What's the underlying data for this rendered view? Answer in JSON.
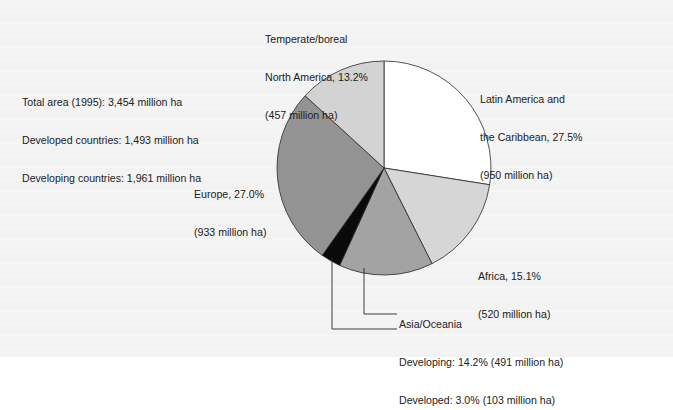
{
  "chart_data": {
    "type": "pie",
    "title": "",
    "unit": "million ha",
    "start_angle_deg": 0,
    "direction": "clockwise",
    "slices": [
      {
        "label": "Latin America and the Caribbean",
        "percent": 27.5,
        "value": 950,
        "color": "#ffffff"
      },
      {
        "label": "Africa",
        "percent": 15.1,
        "value": 520,
        "color": "#d6d6d6"
      },
      {
        "label": "Asia/Oceania Developing",
        "percent": 14.2,
        "value": 491,
        "color": "#a3a3a3"
      },
      {
        "label": "Asia/Oceania Developed",
        "percent": 3.0,
        "value": 103,
        "color": "#0a0a0a"
      },
      {
        "label": "Europe",
        "percent": 27.0,
        "value": 933,
        "color": "#939393"
      },
      {
        "label": "Temperate/boreal North America",
        "percent": 13.2,
        "value": 457,
        "color": "#d3d3d3"
      }
    ],
    "summary": {
      "total_area_1995": 3454,
      "developed_countries": 1493,
      "developing_countries": 1961
    }
  },
  "labels": {
    "summary": {
      "line1": "Total area (1995): 3,454 million ha",
      "line2": "Developed countries: 1,493 million ha",
      "line3": "Developing countries: 1,961 million ha"
    },
    "north_america": {
      "line1": "Temperate/boreal",
      "line2": "North America, 13.2%",
      "line3": "(457 million ha)"
    },
    "latin_america": {
      "line1": "Latin America and",
      "line2": "the Caribbean, 27.5%",
      "line3": "(950 million ha)"
    },
    "europe": {
      "line1": "Europe, 27.0%",
      "line2": "(933 million ha)"
    },
    "africa": {
      "line1": "Africa, 15.1%",
      "line2": "(520 million ha)"
    },
    "asia": {
      "heading": "Asia/Oceania",
      "developing": "Developing: 14.2% (491 million ha)",
      "developed": "Developed: 3.0% (103 million ha)"
    }
  },
  "geometry": {
    "cx": 384,
    "cy": 168,
    "r": 107
  },
  "colors": {
    "stroke": "#2a2a2a",
    "leader": "#2a2a2a",
    "background": "#f3f3f3"
  }
}
